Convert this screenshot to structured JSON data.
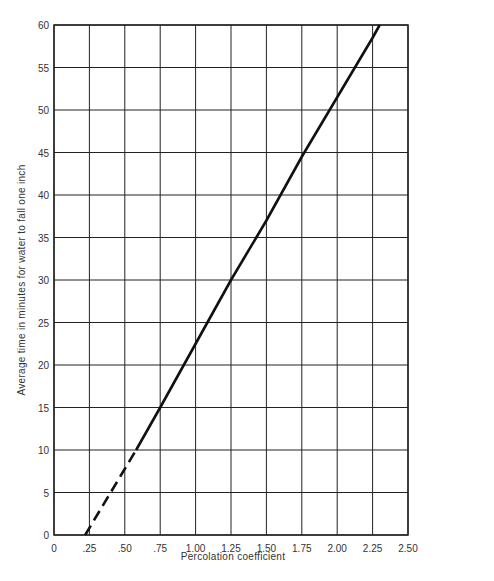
{
  "chart_data": {
    "type": "line",
    "title": "",
    "xlabel": "Percolation coefficient",
    "ylabel": "Average time in minutes for water to fall one inch",
    "xlim": [
      0,
      2.5
    ],
    "ylim": [
      0,
      60
    ],
    "grid": true,
    "legend": "none",
    "x_ticks": [
      "0",
      ".25",
      ".50",
      ".75",
      "1.00",
      "1.25",
      "1.50",
      "1.75",
      "2.00",
      "2.25",
      "2.50"
    ],
    "y_ticks": [
      "0",
      "5",
      "10",
      "15",
      "20",
      "25",
      "30",
      "35",
      "40",
      "45",
      "50",
      "55",
      "60"
    ],
    "series": [
      {
        "name": "extrapolated (dashed)",
        "style": "dashed",
        "x": [
          0.22,
          0.4,
          0.58
        ],
        "y": [
          0,
          5,
          10
        ]
      },
      {
        "name": "measured (solid)",
        "style": "solid",
        "x": [
          0.58,
          0.75,
          1.0,
          1.25,
          1.5,
          1.75,
          2.0,
          2.25,
          2.3
        ],
        "y": [
          10,
          15,
          22.5,
          30,
          37,
          44.5,
          51.5,
          58.5,
          60
        ]
      }
    ],
    "colors": {
      "line": "#111111",
      "grid": "#222222",
      "text": "#333333"
    }
  }
}
